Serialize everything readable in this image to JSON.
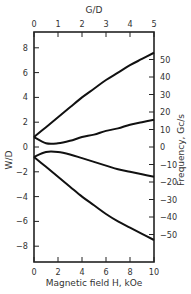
{
  "chart_data": {
    "type": "line",
    "title": "",
    "xlabel": "Magnetic field H, kOe",
    "ylabel": "W/D",
    "x2label": "G/D",
    "y2label": "Frequency, Gc/s",
    "xlim": [
      0,
      10
    ],
    "ylim": [
      -9.2,
      9
    ],
    "x_ticks": [
      "0",
      "2",
      "4",
      "6",
      "8",
      "10"
    ],
    "y_ticks": [
      "8",
      "6",
      "4",
      "2",
      "0",
      "-2",
      "-4",
      "-6",
      "-8"
    ],
    "x2_ticks": [
      "0",
      "1",
      "2",
      "3",
      "4",
      "5"
    ],
    "y2_ticks": [
      "50",
      "40",
      "30",
      "20",
      "10",
      "0",
      "-10",
      "-20",
      "-30",
      "-40",
      "-50"
    ],
    "grid": false,
    "legend": null,
    "x": [
      0,
      1,
      2,
      3,
      4,
      5,
      6,
      7,
      8,
      9,
      10
    ],
    "series": [
      {
        "name": "upper branch",
        "values": [
          0.8,
          1.6,
          2.4,
          3.2,
          4.0,
          4.7,
          5.4,
          6.0,
          6.6,
          7.1,
          7.6
        ]
      },
      {
        "name": "upper-middle branch",
        "values": [
          0.8,
          0.3,
          0.3,
          0.5,
          0.8,
          1.0,
          1.3,
          1.5,
          1.8,
          2.0,
          2.2
        ]
      },
      {
        "name": "lower-middle branch",
        "values": [
          -0.8,
          -0.4,
          -0.4,
          -0.6,
          -0.9,
          -1.2,
          -1.5,
          -1.8,
          -2.0,
          -2.2,
          -2.4
        ]
      },
      {
        "name": "lower branch",
        "values": [
          -0.8,
          -1.6,
          -2.4,
          -3.2,
          -4.0,
          -4.7,
          -5.4,
          -6.0,
          -6.5,
          -7.0,
          -7.5
        ]
      }
    ]
  },
  "labels": {
    "xlabel": "Magnetic field H, kOe",
    "ylabel": "W/D",
    "x2label": "G/D",
    "y2label": "Frequency, Gc/s"
  }
}
